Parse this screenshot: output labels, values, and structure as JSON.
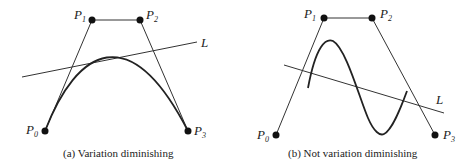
{
  "panels": [
    {
      "caption": "(a) Variation diminishing",
      "points": [
        {
          "name": "P",
          "sub": "0"
        },
        {
          "name": "P",
          "sub": "1"
        },
        {
          "name": "P",
          "sub": "2"
        },
        {
          "name": "P",
          "sub": "3"
        }
      ],
      "line_label": "L"
    },
    {
      "caption": "(b) Not variation diminishing",
      "points": [
        {
          "name": "P",
          "sub": "0"
        },
        {
          "name": "P",
          "sub": "1"
        },
        {
          "name": "P",
          "sub": "2"
        },
        {
          "name": "P",
          "sub": "3"
        }
      ],
      "line_label": "L"
    }
  ]
}
